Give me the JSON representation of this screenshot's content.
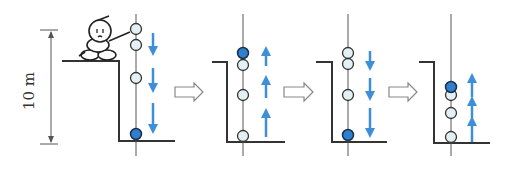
{
  "height_label": "10 m",
  "colors": {
    "line": "#333333",
    "ball_light": "#e3f1f5",
    "ball_highlight": "#2f7fcf",
    "arrow_blue": "#3f8fd6",
    "transition_arrow": "#888888"
  },
  "panels": [
    {
      "id": 1,
      "direction": "down",
      "highlighted_ball": "bottom",
      "has_figure": true
    },
    {
      "id": 2,
      "direction": "up",
      "highlighted_ball": "top"
    },
    {
      "id": 3,
      "direction": "down",
      "highlighted_ball": "bottom"
    },
    {
      "id": 4,
      "direction": "up",
      "highlighted_ball": "top"
    }
  ],
  "transitions": [
    "arrow-1-to-2",
    "arrow-2-to-3",
    "arrow-3-to-4"
  ]
}
